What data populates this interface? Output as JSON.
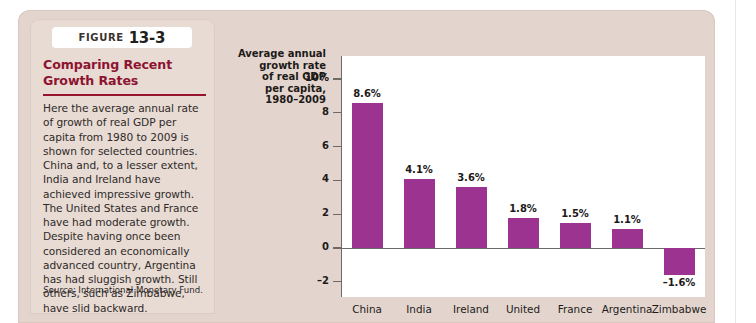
{
  "figure": {
    "label": "FIGURE",
    "number": "13-3",
    "heading": "Comparing Recent Growth Rates",
    "body": "Here the average annual rate of growth of real GDP per capita from 1980 to 2009 is shown for selected countries. China and, to a lesser extent, India and Ireland have achieved impressive growth. The United States and France have had moderate growth. Despite having once been considered an economically advanced country, Argentina has had sluggish growth. Still others, such as Zimbabwe, have slid backward.",
    "source_label": "Source:",
    "source_text": "International Monetary Fund.",
    "heading_color": "#8d1430",
    "card_color": "#e3d5cd"
  },
  "chart_data": {
    "type": "bar",
    "axis_title_lines": [
      "Average annual",
      "growth rate",
      "of real GDP",
      "per capita,",
      "1980–2009"
    ],
    "categories": [
      "China",
      "India",
      "Ireland",
      "United",
      "France",
      "Argentina",
      "Zimbabwe"
    ],
    "values": [
      8.6,
      4.1,
      3.6,
      1.8,
      1.5,
      1.1,
      -1.6
    ],
    "value_labels": [
      "8.6%",
      "4.1%",
      "3.6%",
      "1.8%",
      "1.5%",
      "1.1%",
      "–1.6%"
    ],
    "ytick_labels": [
      "10%",
      "8",
      "6",
      "4",
      "2",
      "0",
      "–2"
    ],
    "ytick_values": [
      10,
      8,
      6,
      4,
      2,
      0,
      -2
    ],
    "ylim": [
      -3,
      10.8
    ],
    "xlabel": "",
    "ylabel": "Average annual growth rate of real GDP per capita, 1980-2009",
    "grid": false,
    "legend": false,
    "bar_color": "#9c3391",
    "axis_color": "#6d6a68"
  }
}
